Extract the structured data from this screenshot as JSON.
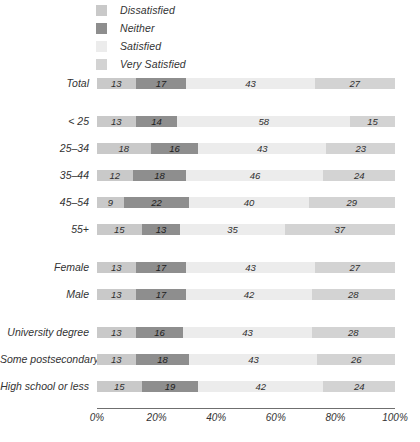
{
  "legend": {
    "items": [
      {
        "label": "Dissatisfied",
        "color": "#c9c9c9",
        "key": "dissatisfied"
      },
      {
        "label": "Neither",
        "color": "#8e8e8e",
        "key": "neither"
      },
      {
        "label": "Satisfied",
        "color": "#ececec",
        "key": "satisfied"
      },
      {
        "label": "Very Satisfied",
        "color": "#d3d3d3",
        "key": "very_satisfied"
      }
    ]
  },
  "chart_data": {
    "type": "bar",
    "orientation": "horizontal",
    "stacked": true,
    "stack_total": 100,
    "title": "",
    "subtitle": "",
    "xlabel": "",
    "ylabel": "",
    "xlim": [
      0,
      100
    ],
    "xticks": [
      "0%",
      "20%",
      "40%",
      "60%",
      "80%",
      "100%"
    ],
    "xtick_values": [
      0,
      20,
      40,
      60,
      80,
      100
    ],
    "grid": false,
    "legend_position": "top-left",
    "categories": [
      "Total",
      "< 25",
      "25–34",
      "35–44",
      "45–54",
      "55+",
      "Female",
      "Male",
      "University degree",
      "Some postsecondary",
      "High school or less"
    ],
    "series": [
      {
        "name": "Dissatisfied",
        "color": "#c9c9c9",
        "values": [
          13,
          13,
          18,
          12,
          9,
          15,
          13,
          13,
          13,
          13,
          15
        ]
      },
      {
        "name": "Neither",
        "color": "#8e8e8e",
        "values": [
          17,
          14,
          16,
          18,
          22,
          13,
          17,
          17,
          16,
          18,
          19
        ]
      },
      {
        "name": "Satisfied",
        "color": "#ececec",
        "values": [
          43,
          58,
          43,
          46,
          40,
          35,
          43,
          42,
          43,
          43,
          42
        ]
      },
      {
        "name": "Very Satisfied",
        "color": "#d3d3d3",
        "values": [
          27,
          15,
          23,
          24,
          29,
          37,
          27,
          28,
          28,
          26,
          24
        ]
      }
    ],
    "rows": [
      {
        "label": "Total",
        "group": 0,
        "values": [
          13,
          17,
          43,
          27
        ]
      },
      {
        "label": "< 25",
        "group": 1,
        "values": [
          13,
          14,
          58,
          15
        ]
      },
      {
        "label": "25–34",
        "group": 1,
        "values": [
          18,
          16,
          43,
          23
        ]
      },
      {
        "label": "35–44",
        "group": 1,
        "values": [
          12,
          18,
          46,
          24
        ]
      },
      {
        "label": "45–54",
        "group": 1,
        "values": [
          9,
          22,
          40,
          29
        ]
      },
      {
        "label": "55+",
        "group": 1,
        "values": [
          15,
          13,
          35,
          37
        ]
      },
      {
        "label": "Female",
        "group": 2,
        "values": [
          13,
          17,
          43,
          27
        ]
      },
      {
        "label": "Male",
        "group": 2,
        "values": [
          13,
          17,
          42,
          28
        ]
      },
      {
        "label": "University degree",
        "group": 3,
        "values": [
          13,
          16,
          43,
          28
        ]
      },
      {
        "label": "Some postsecondary",
        "group": 3,
        "values": [
          13,
          18,
          43,
          26
        ]
      },
      {
        "label": "High school or less",
        "group": 3,
        "values": [
          15,
          19,
          42,
          24
        ]
      }
    ]
  }
}
